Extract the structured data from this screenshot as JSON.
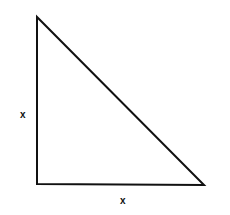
{
  "diagram": {
    "shape": "right-triangle",
    "stroke_color": "#111111",
    "vertices": [
      [
        37,
        17
      ],
      [
        37,
        184
      ],
      [
        204,
        185
      ]
    ],
    "labels": {
      "left_leg": "x",
      "bottom_leg": "x"
    }
  }
}
